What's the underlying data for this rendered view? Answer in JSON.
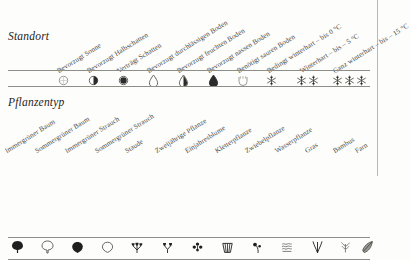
{
  "page": {
    "background_color": "#fdfdfb",
    "rule_color": "#8e8e88",
    "ink_color": "#2b2b2b"
  },
  "sections": [
    {
      "id": "standort",
      "title": "Standort",
      "columns": [
        {
          "label": "Bevorzugt Sonne",
          "icon": "sun-open-circle-icon",
          "x": 62
        },
        {
          "label": "Bevorzugt Halbschatten",
          "icon": "half-shade-half-filled-circle-icon",
          "x": 92
        },
        {
          "label": "Verträgt Schatten",
          "icon": "shade-filled-circle-icon",
          "x": 122
        },
        {
          "label": "Bevorzugt durchlässigen Boden",
          "icon": "drop-outline-icon",
          "x": 152
        },
        {
          "label": "Bevorzugt feuchten Boden",
          "icon": "drop-half-filled-icon",
          "x": 182
        },
        {
          "label": "Bevorzugt nassen Boden",
          "icon": "drop-filled-icon",
          "x": 212
        },
        {
          "label": "Benötigt sauren Boden",
          "icon": "acid-soil-u-shape-icon",
          "x": 242
        },
        {
          "label": "Bedingt winterhart – bis 0 °C",
          "icon": "snowflake-one-icon",
          "x": 272
        },
        {
          "label": "Winterhart – bis – 5 °C",
          "icon": "snowflake-two-icon",
          "x": 305
        },
        {
          "label": "Ganz winterhart – bis – 15 °C",
          "icon": "snowflake-three-icon",
          "x": 341
        }
      ]
    },
    {
      "id": "pflanzentyp",
      "title": "Pflanzentyp",
      "columns": [
        {
          "label": "Immergrüner Baum",
          "icon": "evergreen-tree-filled-icon",
          "x": 16
        },
        {
          "label": "Sommergrüner Baum",
          "icon": "deciduous-tree-outline-icon",
          "x": 46
        },
        {
          "label": "Immergrüner Strauch",
          "icon": "evergreen-shrub-filled-icon",
          "x": 76
        },
        {
          "label": "Sommergrüner Strauch",
          "icon": "deciduous-shrub-outline-icon",
          "x": 106
        },
        {
          "label": "Staude",
          "icon": "perennial-icon",
          "x": 136
        },
        {
          "label": "Zweijährige Pflanze",
          "icon": "biennial-icon",
          "x": 166
        },
        {
          "label": "Einjahresblume",
          "icon": "annual-flower-icon",
          "x": 196
        },
        {
          "label": "Kletterpflanze",
          "icon": "climbing-plant-basket-icon",
          "x": 226
        },
        {
          "label": "Zwiebelpflanze",
          "icon": "bulb-plant-icon",
          "x": 256
        },
        {
          "label": "Wasserpflanze",
          "icon": "water-plant-waves-icon",
          "x": 286
        },
        {
          "label": "Gras",
          "icon": "grass-icon",
          "x": 316
        },
        {
          "label": "Bambus",
          "icon": "bamboo-icon",
          "x": 344
        },
        {
          "label": "Farn",
          "icon": "fern-icon",
          "x": 366
        }
      ]
    }
  ]
}
